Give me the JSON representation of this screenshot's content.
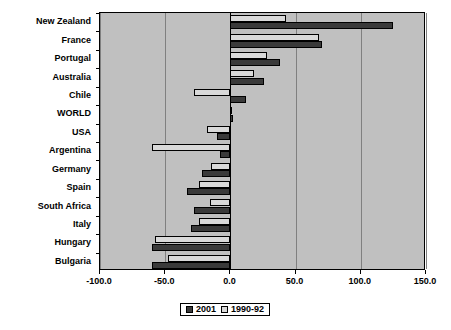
{
  "chart_data": {
    "type": "bar",
    "orientation": "horizontal",
    "title": "",
    "xlabel": "",
    "ylabel": "",
    "xlim": [
      -100.0,
      150.0
    ],
    "xticks": [
      "-100.0",
      "-50.0",
      "0.0",
      "50.0",
      "100.0",
      "150.0"
    ],
    "xtick_values": [
      -100,
      -50,
      0,
      50,
      100,
      150
    ],
    "grid": true,
    "legend_position": "bottom",
    "categories": [
      "New Zealand",
      "France",
      "Portugal",
      "Australia",
      "Chile",
      "WORLD",
      "USA",
      "Argentina",
      "Germany",
      "Spain",
      "South Africa",
      "Italy",
      "Hungary",
      "Bulgaria"
    ],
    "series": [
      {
        "name": "2001",
        "color": "#3a3a3a",
        "values": [
          125,
          70,
          38,
          26,
          12,
          2,
          -10,
          -8,
          -22,
          -33,
          -28,
          -30,
          -60,
          -60
        ]
      },
      {
        "name": "1990-92",
        "color": "#d9d9d9",
        "values": [
          43,
          68,
          28,
          18,
          -28,
          1,
          -18,
          -60,
          -15,
          -24,
          -16,
          -24,
          -58,
          -48
        ]
      }
    ]
  },
  "legend": {
    "items": [
      {
        "label": "2001",
        "swatch": "dark-square-swatch"
      },
      {
        "label": "1990-92",
        "swatch": "light-square-swatch"
      }
    ]
  }
}
